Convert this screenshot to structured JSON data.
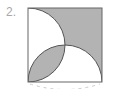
{
  "problem": {
    "number_label": "2."
  },
  "figure": {
    "shade_color": "#b3b3b3",
    "stroke_color": "#555555",
    "square": {
      "x": 28,
      "y": 8,
      "size": 74
    },
    "left_semicircle": {
      "cx": 28,
      "cy": 45,
      "r": 37
    },
    "bottom_semicircle": {
      "cx": 65,
      "cy": 82,
      "r": 37
    }
  }
}
